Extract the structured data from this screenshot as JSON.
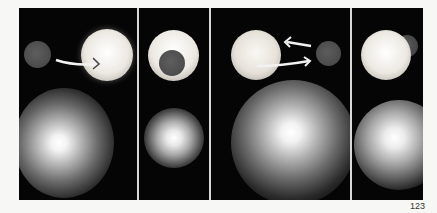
{
  "figure": {
    "panels": [
      {
        "id": "panel-1",
        "description": "small dark sphere left, bright sphere right, arrow from small toward bright"
      },
      {
        "id": "panel-2",
        "description": "dark sphere in front of bright sphere"
      },
      {
        "id": "panel-3",
        "description": "bright sphere left, dark sphere right, arrows both directions"
      },
      {
        "id": "panel-4",
        "description": "bright sphere in front of dark sphere"
      }
    ],
    "colors": {
      "background": "#050505",
      "bright_sphere": "#f0eeea",
      "dark_sphere": "#555555",
      "arrow": "#f2f2f2"
    }
  },
  "page_number": "123"
}
